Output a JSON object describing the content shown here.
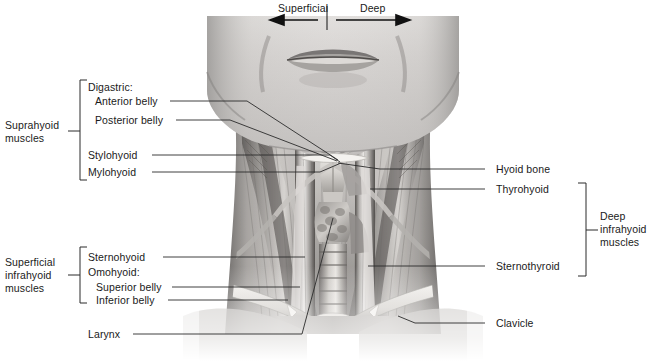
{
  "figure": {
    "orientation": {
      "superficial_label": "Superficial",
      "deep_label": "Deep",
      "superficial_arrow": "left-arrow-icon",
      "deep_arrow": "right-arrow-icon",
      "divider": "vertical-divider"
    }
  },
  "groups": {
    "suprahyoid": {
      "label": "Suprahyoid\nmuscles",
      "line1": "Suprahyoid",
      "line2": "muscles",
      "bracket": "left-bracket-suprahyoid"
    },
    "superficial_infrahyoid": {
      "label": "Superficial\ninfrahyoid\nmuscles",
      "line1": "Superficial",
      "line2": "infrahyoid",
      "line3": "muscles",
      "bracket": "left-bracket-superficial-infrahyoid"
    },
    "deep_infrahyoid": {
      "label": "Deep\ninfrahyoid\nmuscles",
      "line1": "Deep",
      "line2": "infrahyoid",
      "line3": "muscles",
      "bracket": "right-bracket-deep-infrahyoid"
    }
  },
  "labels_left": [
    {
      "id": "digastric-heading",
      "text": "Digastric:",
      "has_leader": false
    },
    {
      "id": "anterior-belly",
      "text": "Anterior belly",
      "has_leader": true
    },
    {
      "id": "posterior-belly",
      "text": "Posterior belly",
      "has_leader": true
    },
    {
      "id": "stylohyoid",
      "text": "Stylohyoid",
      "has_leader": true
    },
    {
      "id": "mylohyoid",
      "text": "Mylohyoid",
      "has_leader": true
    },
    {
      "id": "sternohyoid",
      "text": "Sternohyoid",
      "has_leader": true
    },
    {
      "id": "omohyoid-heading",
      "text": "Omohyoid:",
      "has_leader": false
    },
    {
      "id": "superior-belly",
      "text": "Superior belly",
      "has_leader": true
    },
    {
      "id": "inferior-belly",
      "text": "Inferior belly",
      "has_leader": true
    },
    {
      "id": "larynx",
      "text": "Larynx",
      "has_leader": true
    }
  ],
  "labels_right": [
    {
      "id": "hyoid-bone",
      "text": "Hyoid bone",
      "has_leader": true
    },
    {
      "id": "thyrohyoid",
      "text": "Thyrohyoid",
      "has_leader": true
    },
    {
      "id": "sternothyroid",
      "text": "Sternothyroid",
      "has_leader": true
    },
    {
      "id": "clavicle",
      "text": "Clavicle",
      "has_leader": true
    }
  ],
  "colors": {
    "background": "#ffffff",
    "line": "#2b2b2b",
    "text": "#1a1a1a",
    "skin_light": "#d8d6d4",
    "skin_mid": "#b6b3b1",
    "skin_dark": "#8d8a88",
    "muscle_light": "#e2e0dd",
    "muscle_mid": "#9e9b98",
    "muscle_dark": "#5d5a58",
    "deep_shadow": "#3a3836",
    "bone": "#efedea"
  }
}
